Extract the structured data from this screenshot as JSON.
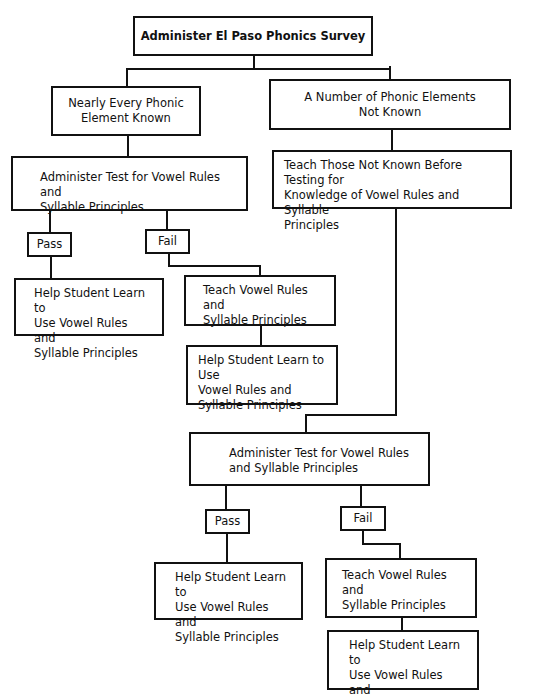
{
  "flowchart": {
    "root": {
      "label": "Administer El Paso Phonics Survey"
    },
    "left_branch": {
      "condition": [
        "Nearly Every Phonic",
        "Element Known"
      ],
      "test": [
        "Administer Test for Vowel Rules and",
        "Syllable Principles"
      ],
      "pass": {
        "label": "Pass",
        "action": [
          "Help Student Learn to",
          "Use Vowel Rules and",
          "Syllable Principles"
        ]
      },
      "fail": {
        "label": "Fail",
        "teach": [
          "Teach Vowel Rules and",
          "Syllable Principles"
        ],
        "action": [
          "Help Student Learn to Use",
          "Vowel Rules and",
          "Syllable Principles"
        ]
      }
    },
    "right_branch": {
      "condition": [
        "A Number of Phonic Elements",
        "Not Known"
      ],
      "teach_first": [
        "Teach Those Not Known Before Testing for",
        "Knowledge of Vowel Rules and Syllable",
        "Principles"
      ],
      "test": [
        "Administer Test for Vowel Rules",
        "and Syllable Principles"
      ],
      "pass": {
        "label": "Pass",
        "action": [
          "Help Student Learn to",
          "Use Vowel Rules and",
          "Syllable Principles"
        ]
      },
      "fail": {
        "label": "Fail",
        "teach": [
          "Teach Vowel Rules and",
          "Syllable Principles"
        ],
        "action": [
          "Help Student Learn to",
          "Use Vowel Rules and",
          "Syllable Principles"
        ]
      }
    }
  }
}
